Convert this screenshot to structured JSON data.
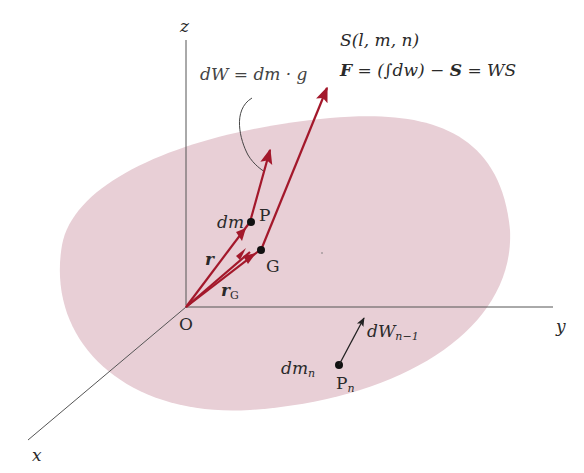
{
  "diagram": {
    "colors": {
      "body_fill": "#e8cfd6",
      "axis": "#555555",
      "vector": "#a3182b",
      "weight_arrow": "#222222",
      "text": "#2a2a2a"
    },
    "axes": {
      "x_label": "x",
      "y_label": "y",
      "z_label": "z",
      "origin_label": "O"
    },
    "points": {
      "P": "P",
      "G": "G",
      "Pn_main": "P",
      "Pn_sub": "n"
    },
    "labels": {
      "dm": "dm",
      "r": "r",
      "rG_main": "r",
      "rG_sub": "G",
      "dmn_main": "dm",
      "dmn_sub": "n",
      "dWn_main": "dW",
      "dWn_sub": "n−1",
      "dW_eq": "dW = dm · g",
      "S_vector": "S(l, m, n)",
      "F_eq_F": "F",
      "F_eq_mid": " = (∫dw) − ",
      "F_eq_S": "S",
      "F_eq_end": " = WS"
    }
  }
}
